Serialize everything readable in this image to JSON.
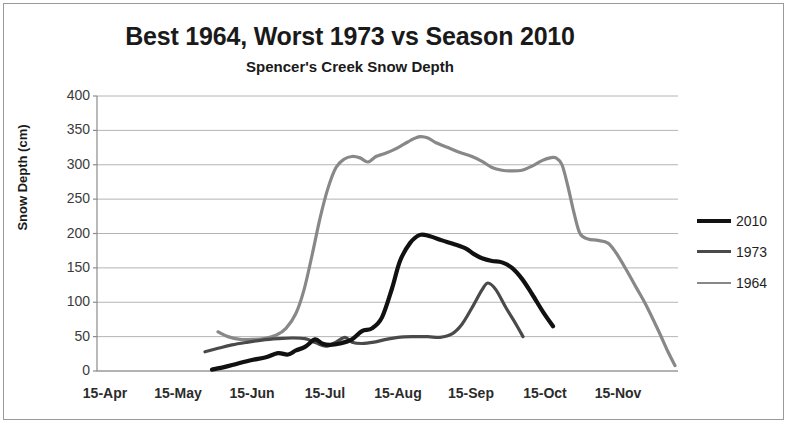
{
  "chart_data": {
    "type": "line",
    "title": "Best 1964, Worst 1973 vs Season 2010",
    "subtitle": "Spencer's Creek Snow Depth",
    "xlabel": "",
    "ylabel": "Snow Depth (cm)",
    "ylim": [
      0,
      400
    ],
    "ytick_labels": [
      "400",
      "350",
      "300",
      "250",
      "200",
      "150",
      "100",
      "50",
      "0"
    ],
    "ytick_values": [
      400,
      350,
      300,
      250,
      200,
      150,
      100,
      50,
      0
    ],
    "xtick_labels": [
      "15-Apr",
      "15-May",
      "15-Jun",
      "15-Jul",
      "15-Aug",
      "15-Sep",
      "15-Oct",
      "15-Nov"
    ],
    "grid": "horizontal",
    "legend_position": "right",
    "series": [
      {
        "name": "2010",
        "color": "#111111",
        "width": 4.2,
        "points": [
          [
            212,
            2
          ],
          [
            225,
            6
          ],
          [
            238,
            11
          ],
          [
            252,
            16
          ],
          [
            266,
            20
          ],
          [
            278,
            26
          ],
          [
            288,
            24
          ],
          [
            296,
            30
          ],
          [
            305,
            35
          ],
          [
            315,
            46
          ],
          [
            322,
            40
          ],
          [
            330,
            38
          ],
          [
            340,
            40
          ],
          [
            352,
            46
          ],
          [
            362,
            58
          ],
          [
            372,
            62
          ],
          [
            382,
            78
          ],
          [
            392,
            120
          ],
          [
            400,
            160
          ],
          [
            410,
            186
          ],
          [
            420,
            198
          ],
          [
            430,
            196
          ],
          [
            442,
            190
          ],
          [
            455,
            184
          ],
          [
            466,
            178
          ],
          [
            474,
            170
          ],
          [
            482,
            164
          ],
          [
            492,
            160
          ],
          [
            502,
            158
          ],
          [
            512,
            150
          ],
          [
            522,
            134
          ],
          [
            532,
            112
          ],
          [
            543,
            86
          ],
          [
            553,
            65
          ]
        ]
      },
      {
        "name": "1973",
        "color": "#4a4a4a",
        "width": 3.2,
        "points": [
          [
            205,
            28
          ],
          [
            218,
            33
          ],
          [
            232,
            38
          ],
          [
            248,
            42
          ],
          [
            262,
            45
          ],
          [
            278,
            47
          ],
          [
            292,
            48
          ],
          [
            305,
            47
          ],
          [
            316,
            41
          ],
          [
            326,
            36
          ],
          [
            336,
            42
          ],
          [
            345,
            49
          ],
          [
            352,
            42
          ],
          [
            362,
            40
          ],
          [
            374,
            42
          ],
          [
            386,
            46
          ],
          [
            398,
            49
          ],
          [
            412,
            50
          ],
          [
            428,
            50
          ],
          [
            440,
            49
          ],
          [
            452,
            54
          ],
          [
            462,
            68
          ],
          [
            472,
            92
          ],
          [
            482,
            118
          ],
          [
            488,
            128
          ],
          [
            496,
            118
          ],
          [
            506,
            92
          ],
          [
            516,
            68
          ],
          [
            523,
            50
          ]
        ]
      },
      {
        "name": "1964",
        "color": "#888888",
        "width": 3.2,
        "points": [
          [
            218,
            57
          ],
          [
            228,
            50
          ],
          [
            240,
            46
          ],
          [
            252,
            46
          ],
          [
            264,
            47
          ],
          [
            276,
            52
          ],
          [
            286,
            62
          ],
          [
            296,
            84
          ],
          [
            304,
            118
          ],
          [
            312,
            168
          ],
          [
            320,
            222
          ],
          [
            328,
            266
          ],
          [
            336,
            296
          ],
          [
            344,
            308
          ],
          [
            352,
            312
          ],
          [
            360,
            310
          ],
          [
            368,
            304
          ],
          [
            376,
            312
          ],
          [
            384,
            316
          ],
          [
            394,
            322
          ],
          [
            404,
            330
          ],
          [
            414,
            338
          ],
          [
            420,
            341
          ],
          [
            428,
            339
          ],
          [
            436,
            332
          ],
          [
            448,
            325
          ],
          [
            460,
            318
          ],
          [
            472,
            312
          ],
          [
            482,
            305
          ],
          [
            492,
            296
          ],
          [
            502,
            292
          ],
          [
            512,
            291
          ],
          [
            522,
            292
          ],
          [
            532,
            298
          ],
          [
            542,
            306
          ],
          [
            550,
            310
          ],
          [
            556,
            310
          ],
          [
            562,
            300
          ],
          [
            568,
            268
          ],
          [
            574,
            230
          ],
          [
            580,
            200
          ],
          [
            588,
            192
          ],
          [
            598,
            190
          ],
          [
            608,
            186
          ],
          [
            616,
            172
          ],
          [
            626,
            148
          ],
          [
            636,
            122
          ],
          [
            646,
            96
          ],
          [
            658,
            60
          ],
          [
            668,
            28
          ],
          [
            675,
            8
          ]
        ]
      }
    ]
  },
  "axes": {
    "plot_left": 97,
    "plot_right": 678,
    "plot_top": 96,
    "plot_bottom": 371,
    "xtick_positions": [
      105,
      178,
      252,
      325,
      398,
      471,
      545,
      618
    ]
  },
  "legend": {
    "entries": [
      {
        "label": "2010",
        "color": "#111111",
        "thickness": 4
      },
      {
        "label": "1973",
        "color": "#4a4a4a",
        "thickness": 3
      },
      {
        "label": "1964",
        "color": "#888888",
        "thickness": 2
      }
    ]
  }
}
